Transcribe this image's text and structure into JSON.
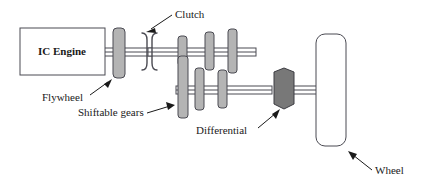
{
  "figure": {
    "background_color": "#ffffff"
  },
  "components": {
    "engine": {
      "label": "IC Engine",
      "shape": "rectangle",
      "fill": "#ffffff",
      "stroke": "#4a4a52"
    },
    "flywheel": {
      "label": "Flywheel",
      "shape": "rounded-rectangle",
      "fill": "#b4b4b4",
      "stroke": "#4a4a52"
    },
    "clutch": {
      "label": "Clutch",
      "shape": "facing-arcs",
      "stroke": "#4a4a52"
    },
    "shiftable_gears": {
      "label": "Shiftable gears",
      "shape": "rounded-rectangle",
      "fill": "#b4b4b4",
      "stroke": "#4a4a52",
      "upper_shaft_gear_count": 3,
      "lower_shaft_gear_count": 4
    },
    "differential": {
      "label": "Differential",
      "shape": "hexagon",
      "fill": "#787878",
      "stroke": "#3c3c42"
    },
    "wheel": {
      "label": "Wheel",
      "shape": "rounded-rectangle",
      "fill": "#ffffff",
      "stroke": "#4a4a52"
    }
  },
  "labels": {
    "engine": "IC Engine",
    "flywheel": "Flywheel",
    "clutch": "Clutch",
    "shiftable_gears": "Shiftable gears",
    "differential": "Differential",
    "wheel": "Wheel"
  }
}
